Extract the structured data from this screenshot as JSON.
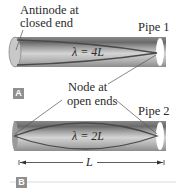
{
  "figure": {
    "panel_a": {
      "label": "A",
      "pipe_label": "Pipe 1",
      "wavelength": "λ = 4L",
      "annotation_closed": [
        "Antinode at",
        "closed end"
      ]
    },
    "panel_b": {
      "label": "B",
      "pipe_label": "Pipe 2",
      "wavelength": "λ = 2L",
      "dimension": "L"
    },
    "shared_annotation": [
      "Node at",
      "open ends"
    ],
    "colors": {
      "pipe_dark": "#6e6e6e",
      "pipe_mid": "#a8a8a8",
      "pipe_light": "#d8d8d8",
      "wave": "#4a4a4a",
      "label_box": "#8f8f8f"
    }
  }
}
